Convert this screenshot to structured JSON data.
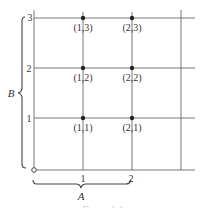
{
  "diagram": {
    "x_ticks": [
      "1",
      "2"
    ],
    "y_ticks": [
      "1",
      "2",
      "3"
    ],
    "points": [
      {
        "label": "(1,1)"
      },
      {
        "label": "(2,1)"
      },
      {
        "label": "(1,2)"
      },
      {
        "label": "(2,2)"
      },
      {
        "label": "(1,3)"
      },
      {
        "label": "(2,3)"
      }
    ],
    "brace_x_label": "A",
    "brace_y_label": "B",
    "caption": "Figure 1.1"
  }
}
